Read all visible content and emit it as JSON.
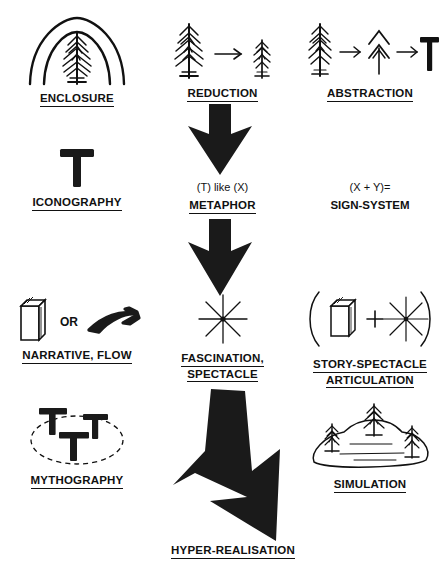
{
  "diagram": {
    "background_color": "#ffffff",
    "ink_color": "#111111",
    "columns": 3,
    "rows": 4
  },
  "cells": {
    "enclosure": {
      "label": "ENCLOSURE",
      "underlined": true,
      "icon": "tree-under-two-arcs-icon"
    },
    "reduction": {
      "label": "REDUCTION",
      "underlined": true,
      "icon": "large-tree-arrow-small-tree-icon"
    },
    "abstraction": {
      "label": "ABSTRACTION",
      "underlined": true,
      "icon": "tree-arrow-chevron-tree-arrow-t-glyph-icon"
    },
    "iconography": {
      "label": "ICONOGRAPHY",
      "underlined": true,
      "icon": "t-glyph-icon"
    },
    "metaphor": {
      "formula": "(T) like (X)",
      "label": "METAPHOR",
      "underlined": true
    },
    "sign_system": {
      "formula": "(X + Y)=",
      "label": "SIGN-SYSTEM",
      "underlined": false
    },
    "narrative_flow": {
      "label": "NARRATIVE, FLOW",
      "underlined": true,
      "connector": "OR",
      "icon_left": "book-icon",
      "icon_right": "swoosh-flow-arrow-icon"
    },
    "fascination_spectacle": {
      "label_line1": "FASCINATION,",
      "label_line2": "SPECTACLE",
      "underlined": true,
      "icon": "eight-point-star-icon"
    },
    "story_spectacle": {
      "label_line1": "STORY-SPECTACLE",
      "label_line2": "ARTICULATION",
      "underlined": true,
      "icon": "parenthesised-book-plus-star-icon"
    },
    "mythography": {
      "label": "MYTHOGRAPHY",
      "underlined": true,
      "icon": "three-t-glyphs-in-dashed-ellipse-icon"
    },
    "simulation": {
      "label": "SIMULATION",
      "underlined": true,
      "icon": "three-trees-on-hill-icon"
    },
    "hyper_realisation": {
      "label": "HYPER-REALISATION",
      "underlined": true,
      "icon": "large-diagonal-down-arrow-icon"
    }
  },
  "arrows": [
    {
      "name": "arrow-reduction-to-metaphor",
      "direction": "down",
      "style": "thick-block"
    },
    {
      "name": "arrow-metaphor-to-spectacle",
      "direction": "down",
      "style": "thick-block"
    },
    {
      "name": "arrow-spectacle-to-hyper-realisation",
      "direction": "down-right",
      "style": "thick-block-diagonal"
    }
  ]
}
